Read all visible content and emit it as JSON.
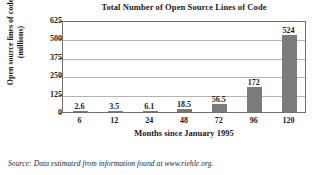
{
  "chart_data": {
    "type": "bar",
    "title": "Total Number of Open Source Lines of Code",
    "xlabel": "Months since January 1995",
    "ylabel_line1": "Open source lines of code",
    "ylabel_line2": "(millions)",
    "categories": [
      "6",
      "12",
      "24",
      "48",
      "72",
      "96",
      "120"
    ],
    "values": [
      2.6,
      3.5,
      6.1,
      18.5,
      56.5,
      172,
      524
    ],
    "value_labels": [
      "2.6",
      "3.5",
      "6.1",
      "18.5",
      "56.5",
      "172",
      "524"
    ],
    "ylim": [
      0,
      625
    ],
    "yticks": [
      0,
      125,
      250,
      375,
      500,
      625
    ],
    "ytick_labels": [
      "0",
      "125",
      "250",
      "375",
      "500",
      "625"
    ],
    "grid": true,
    "grid_axis": "y",
    "legend": false,
    "bar_color": "#7b7b7b",
    "frame_color": "#6e6e6e",
    "grid_color": "#b4b4b4",
    "text_color": "#1a1a1a",
    "background": "#ffffff"
  },
  "source": {
    "note": "Source: Data estimated from information found at www.riehle.org."
  }
}
